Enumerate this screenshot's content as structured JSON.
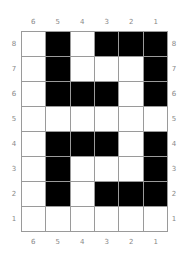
{
  "columns": [
    "6",
    "5",
    "4",
    "3",
    "2",
    "1"
  ],
  "rows": [
    "8",
    "7",
    "6",
    "5",
    "4",
    "3",
    "2",
    "1"
  ],
  "cells": [
    [
      0,
      1,
      0,
      1,
      1,
      1
    ],
    [
      0,
      1,
      0,
      0,
      0,
      1
    ],
    [
      0,
      1,
      1,
      1,
      0,
      1
    ],
    [
      0,
      0,
      0,
      0,
      0,
      0
    ],
    [
      0,
      1,
      1,
      1,
      0,
      1
    ],
    [
      0,
      1,
      0,
      0,
      0,
      1
    ],
    [
      0,
      1,
      0,
      1,
      1,
      1
    ],
    [
      0,
      0,
      0,
      0,
      0,
      0
    ]
  ],
  "colors": {
    "on": "#000000",
    "off": "#ffffff",
    "grid": "#9a9a9a",
    "label": "#888888"
  }
}
